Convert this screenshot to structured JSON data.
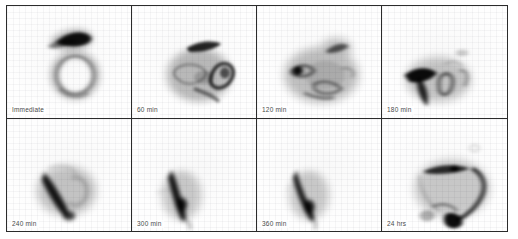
{
  "figure": {
    "layout": {
      "columns": 4,
      "rows": 2,
      "panel_count": 8
    },
    "style": {
      "border_color": "#2b2b2b",
      "background_color": "#ffffff",
      "panel_background": "#fefefe",
      "label_color": "#4a4a4a",
      "activity_color": "#000000",
      "colormap": "grayscale-inverted"
    }
  },
  "panels": [
    {
      "id": "panel-immediate",
      "label": "Immediate",
      "row": 1,
      "col": 1,
      "description": "Intense linear uptake upper-center with faint ring-shaped structure below"
    },
    {
      "id": "panel-60min",
      "label": "60 min",
      "row": 1,
      "col": 2,
      "description": "Linear band upper-right with diffuse cluster of activity below and to the right"
    },
    {
      "id": "panel-120min",
      "label": "120 min",
      "row": 1,
      "col": 3,
      "description": "Broad diffuse activity center with a dense focal hotspot on the left"
    },
    {
      "id": "panel-180min",
      "label": "180 min",
      "row": 1,
      "col": 4,
      "description": "Dense hooked band on the left with scattered faint activity to the right"
    },
    {
      "id": "panel-240min",
      "label": "240 min",
      "row": 2,
      "col": 1,
      "description": "Oblique elongated band of activity with faint surrounding halo"
    },
    {
      "id": "panel-300min",
      "label": "300 min",
      "row": 2,
      "col": 2,
      "description": "Narrow vertical elongated band of activity, slightly curved"
    },
    {
      "id": "panel-360min",
      "label": "360 min",
      "row": 2,
      "col": 3,
      "description": "Narrow curved band of activity, tapering inferiorly"
    },
    {
      "id": "panel-24hrs",
      "label": "24 hrs",
      "row": 2,
      "col": 4,
      "description": "Arc of activity across upper field with dense focal accumulation inferiorly"
    }
  ]
}
